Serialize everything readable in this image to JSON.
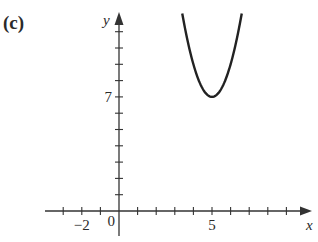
{
  "panel_label": "(c)",
  "chart_data": {
    "type": "line",
    "title": "",
    "panel": "(c)",
    "xlabel": "x",
    "ylabel": "y",
    "x_tick_labels": [
      {
        "value": -2,
        "label": "−2"
      },
      {
        "value": 0,
        "label": "0"
      },
      {
        "value": 5,
        "label": "5"
      }
    ],
    "y_tick_labels": [
      {
        "value": 7,
        "label": "7"
      }
    ],
    "x_ticks": [
      -3,
      -2,
      -1,
      1,
      2,
      3,
      4,
      5,
      6,
      7,
      8,
      9
    ],
    "y_ticks": [
      1,
      2,
      3,
      4,
      5,
      6,
      7,
      8,
      9,
      10,
      11
    ],
    "xlim": [
      -4,
      10.5
    ],
    "ylim": [
      -1.5,
      12.1
    ],
    "grid": false,
    "legend": null,
    "series": [
      {
        "name": "parabola",
        "description": "Upward-opening parabola with vertex at (5, 7)",
        "equation": "y = 2(x - 5)^2 + 7",
        "vertex": [
          5,
          7
        ],
        "x": [
          3.4,
          3.6,
          3.8,
          4.0,
          4.2,
          4.4,
          4.6,
          4.8,
          5.0,
          5.2,
          5.4,
          5.6,
          5.8,
          6.0,
          6.2,
          6.4,
          6.6
        ],
        "y": [
          12.12,
          10.92,
          9.88,
          9.0,
          8.28,
          7.72,
          7.32,
          7.08,
          7.0,
          7.08,
          7.32,
          7.72,
          8.28,
          9.0,
          9.88,
          10.92,
          12.12
        ]
      }
    ]
  }
}
